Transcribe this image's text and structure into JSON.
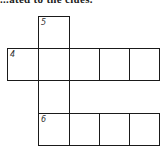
{
  "header": {
    "text": "...ated to the clues."
  },
  "crossword": {
    "clues": {
      "down_5": {
        "number": "5",
        "direction": "down",
        "length": 4
      },
      "across_4": {
        "number": "4",
        "direction": "across",
        "length": 5
      },
      "across_6": {
        "number": "6",
        "direction": "across",
        "length": 4
      }
    },
    "labels": {
      "n5": "5",
      "n4": "4",
      "n6": "6"
    },
    "cells": {
      "c5_1": "",
      "c4_1": "",
      "c4_2": "",
      "c4_3": "",
      "c4_4": "",
      "c4_5": "",
      "c5_3": "",
      "c6_1": "",
      "c6_2": "",
      "c6_3": "",
      "c6_4": ""
    }
  }
}
